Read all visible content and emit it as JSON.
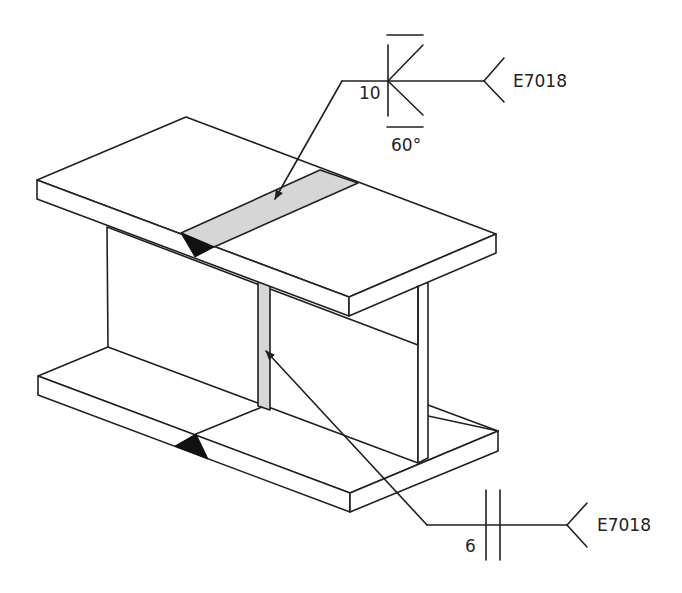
{
  "diagram": {
    "colors": {
      "line": "#231f20",
      "weld_fill": "#d6d6d6",
      "weld_root_marker": "#111111",
      "background": "#ffffff"
    },
    "upper_weld_symbol": {
      "size_label": "10",
      "angle_label": "60°",
      "electrode_label": "E7018",
      "symbol_type": "double-V groove weld with flush contour",
      "points_to": "flange butt weld (shaded band on top flange)"
    },
    "lower_weld_symbol": {
      "size_label": "6",
      "electrode_label": "E7018",
      "symbol_type": "square groove weld",
      "points_to": "web butt weld (shaded vertical strip)"
    }
  }
}
